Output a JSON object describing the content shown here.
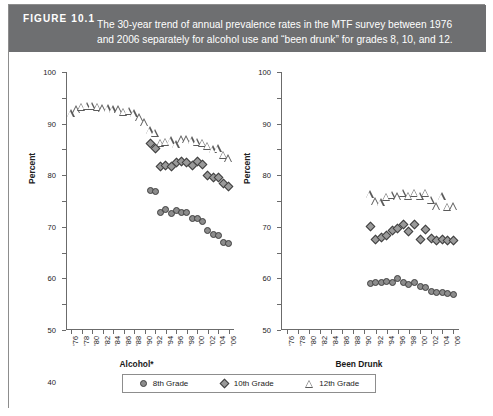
{
  "figure": {
    "number_label": "FIGURE 10.1",
    "caption_line1": "The 30-year trend of annual prevalence rates in the MTF survey between 1976",
    "caption_line2": "and 2006 separately for alcohol use and “been drunk” for grades 8, 10, and 12.",
    "header_color": "#6e6f71",
    "border_color": "#8d8d8d"
  },
  "legend": {
    "items": [
      {
        "label": "8th Grade",
        "marker": "circle-icon"
      },
      {
        "label": "10th Grade",
        "marker": "diamond-icon"
      },
      {
        "label": "12th Grade",
        "marker": "triangle-icon"
      }
    ]
  },
  "chart_data": [
    {
      "id": "alcohol",
      "type": "scatter",
      "title": "",
      "xlabel": "Alcohol*",
      "ylabel": "Percent",
      "ylim": [
        0,
        100
      ],
      "yticks": [
        0,
        10,
        20,
        30,
        40,
        50,
        60,
        70,
        80,
        90,
        100
      ],
      "ytick_labels": [
        "0",
        "10",
        "20",
        "30",
        "40",
        "50",
        "60",
        "70",
        "80",
        "90",
        "100"
      ],
      "xlim": [
        1975,
        2007
      ],
      "xticks": [
        1976,
        1978,
        1980,
        1982,
        1984,
        1986,
        1988,
        1990,
        1992,
        1994,
        1996,
        1998,
        2000,
        2002,
        2004,
        2006
      ],
      "xtick_labels": [
        "'76",
        "'78",
        "'80",
        "'82",
        "'84",
        "'86",
        "'88",
        "'90",
        "'92",
        "'94",
        "'96",
        "'98",
        "'00",
        "'02",
        "'04",
        "'06"
      ],
      "grid": false,
      "series": [
        {
          "name": "12th Grade",
          "marker": "triangle",
          "x": [
            1976,
            1977,
            1978,
            1979,
            1980,
            1981,
            1982,
            1983,
            1984,
            1985,
            1986,
            1987,
            1988,
            1989,
            1990,
            1991,
            1992,
            1993,
            1994,
            1995,
            1996,
            1997,
            1998,
            1999,
            2000,
            2001,
            2002,
            2003,
            2004,
            2005,
            2006
          ],
          "y": [
            84.0,
            85.5,
            86.5,
            87.0,
            87.0,
            86.5,
            86.0,
            86.0,
            85.5,
            85.5,
            84.5,
            85.0,
            84.0,
            82.5,
            80.5,
            77.5,
            76.5,
            72.5,
            73.0,
            73.5,
            72.0,
            74.0,
            74.0,
            73.5,
            73.0,
            72.5,
            71.5,
            70.0,
            70.5,
            68.0,
            66.5
          ],
          "ylabel_units": "percent"
        },
        {
          "name": "10th Grade",
          "marker": "diamond",
          "x": [
            1991,
            1992,
            1993,
            1994,
            1995,
            1996,
            1997,
            1998,
            1999,
            2000,
            2001,
            2002,
            2003,
            2004,
            2005,
            2006
          ],
          "y": [
            72.3,
            70.2,
            63.4,
            63.9,
            63.5,
            65.0,
            65.2,
            65.0,
            63.7,
            65.3,
            64.0,
            60.0,
            59.3,
            59.0,
            56.7,
            55.8
          ],
          "ylabel_units": "percent"
        },
        {
          "name": "8th Grade",
          "marker": "circle",
          "x": [
            1991,
            1992,
            1993,
            1994,
            1995,
            1996,
            1997,
            1998,
            1999,
            2000,
            2001,
            2002,
            2003,
            2004,
            2005,
            2006
          ],
          "y": [
            54.0,
            53.7,
            45.4,
            46.8,
            45.3,
            46.5,
            45.5,
            45.7,
            43.1,
            43.1,
            41.9,
            38.7,
            37.2,
            36.7,
            33.9,
            33.6
          ],
          "ylabel_units": "percent"
        }
      ]
    },
    {
      "id": "been_drunk",
      "type": "scatter",
      "title": "",
      "xlabel": "Been Drunk",
      "ylabel": "Percent",
      "ylim": [
        0,
        100
      ],
      "yticks": [
        0,
        10,
        20,
        30,
        40,
        50,
        60,
        70,
        80,
        90,
        100
      ],
      "ytick_labels": [
        "0",
        "10",
        "20",
        "30",
        "40",
        "50",
        "60",
        "70",
        "80",
        "90",
        "100"
      ],
      "xlim": [
        1975,
        2007
      ],
      "xticks": [
        1976,
        1978,
        1980,
        1982,
        1984,
        1986,
        1988,
        1990,
        1992,
        1994,
        1996,
        1998,
        2000,
        2002,
        2004,
        2006
      ],
      "xtick_labels": [
        "'76",
        "'78",
        "'80",
        "'82",
        "'84",
        "'86",
        "'88",
        "'90",
        "'92",
        "'94",
        "'96",
        "'98",
        "'00",
        "'02",
        "'04",
        "'06"
      ],
      "grid": false,
      "series": [
        {
          "name": "12th Grade",
          "marker": "triangle",
          "x": [
            1991,
            1992,
            1993,
            1994,
            1995,
            1996,
            1997,
            1998,
            1999,
            2000,
            2001,
            2002,
            2003,
            2004,
            2005,
            2006
          ],
          "y": [
            52.7,
            50.0,
            49.6,
            51.7,
            52.5,
            51.9,
            53.2,
            52.0,
            53.2,
            52.0,
            53.2,
            50.4,
            48.0,
            51.8,
            47.7,
            47.9
          ],
          "ylabel_units": "percent"
        },
        {
          "name": "10th Grade",
          "marker": "diamond",
          "x": [
            1991,
            1992,
            1993,
            1994,
            1995,
            1996,
            1997,
            1998,
            1999,
            2000,
            2001,
            2002,
            2003,
            2004,
            2005,
            2006
          ],
          "y": [
            40.1,
            35.0,
            35.9,
            36.8,
            38.5,
            39.4,
            40.7,
            38.3,
            40.9,
            35.2,
            39.0,
            35.4,
            34.6,
            35.0,
            34.5,
            34.5
          ],
          "ylabel_units": "percent"
        },
        {
          "name": "8th Grade",
          "marker": "circle",
          "x": [
            1991,
            1992,
            1993,
            1994,
            1995,
            1996,
            1997,
            1998,
            1999,
            2000,
            2001,
            2002,
            2003,
            2004,
            2005,
            2006
          ],
          "y": [
            18.0,
            18.4,
            18.3,
            18.9,
            18.4,
            19.8,
            18.4,
            17.6,
            18.5,
            17.0,
            16.6,
            15.0,
            14.5,
            14.5,
            14.2,
            13.8
          ],
          "ylabel_units": "percent"
        }
      ]
    }
  ]
}
